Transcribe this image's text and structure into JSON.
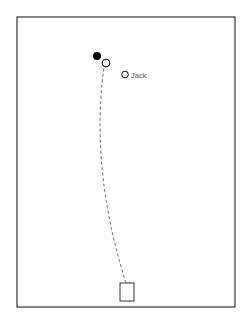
{
  "diagram": {
    "frame": {
      "x": 17,
      "y": 17,
      "width": 218,
      "height": 290,
      "stroke": "#333333"
    },
    "ball_filled": {
      "cx": 97,
      "cy": 56,
      "r": 4,
      "fill": "#000000"
    },
    "ball_open": {
      "cx": 106,
      "cy": 63,
      "r": 4,
      "stroke": "#000000"
    },
    "jack": {
      "cx": 125,
      "cy": 74.5,
      "r": 3.5,
      "label": "Jack"
    },
    "trajectory": {
      "style": "dashed",
      "from": [
        126,
        283
      ],
      "to": [
        104,
        67
      ]
    },
    "mat": {
      "x": 120,
      "y": 283,
      "width": 14,
      "height": 18
    }
  }
}
